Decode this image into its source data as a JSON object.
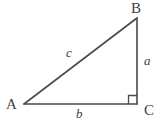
{
  "figure": {
    "type": "right-triangle-diagram",
    "background_color": "#ffffff",
    "stroke_color": "#4a4a4a",
    "label_color": "#3f3f3f",
    "vertices": [
      {
        "name": "A",
        "label": "A",
        "x": 24,
        "y": 104,
        "angle": "acute"
      },
      {
        "name": "B",
        "label": "B",
        "x": 137,
        "y": 18,
        "angle": "acute"
      },
      {
        "name": "C",
        "label": "C",
        "x": 137,
        "y": 104,
        "angle": "right"
      }
    ],
    "sides": [
      {
        "name": "hypotenuse",
        "label": "c",
        "from": "A",
        "to": "B"
      },
      {
        "name": "opposite",
        "label": "a",
        "from": "B",
        "to": "C"
      },
      {
        "name": "adjacent",
        "label": "b",
        "from": "A",
        "to": "C"
      }
    ],
    "right_angle_marker": {
      "at_vertex": "C",
      "size": 8,
      "label": "right-angle-marker"
    }
  }
}
